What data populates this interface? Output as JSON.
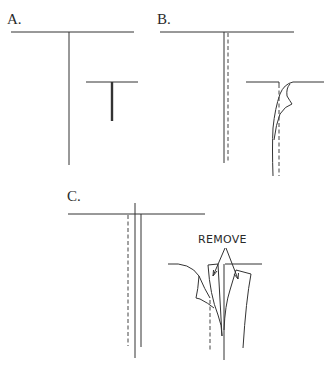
{
  "panels": [
    {
      "id": "A",
      "label": "A."
    },
    {
      "id": "B",
      "label": "B."
    },
    {
      "id": "C",
      "label": "C.",
      "annotation": "REMOVE"
    }
  ],
  "colors": {
    "line": "#333333",
    "background": "#ffffff"
  }
}
